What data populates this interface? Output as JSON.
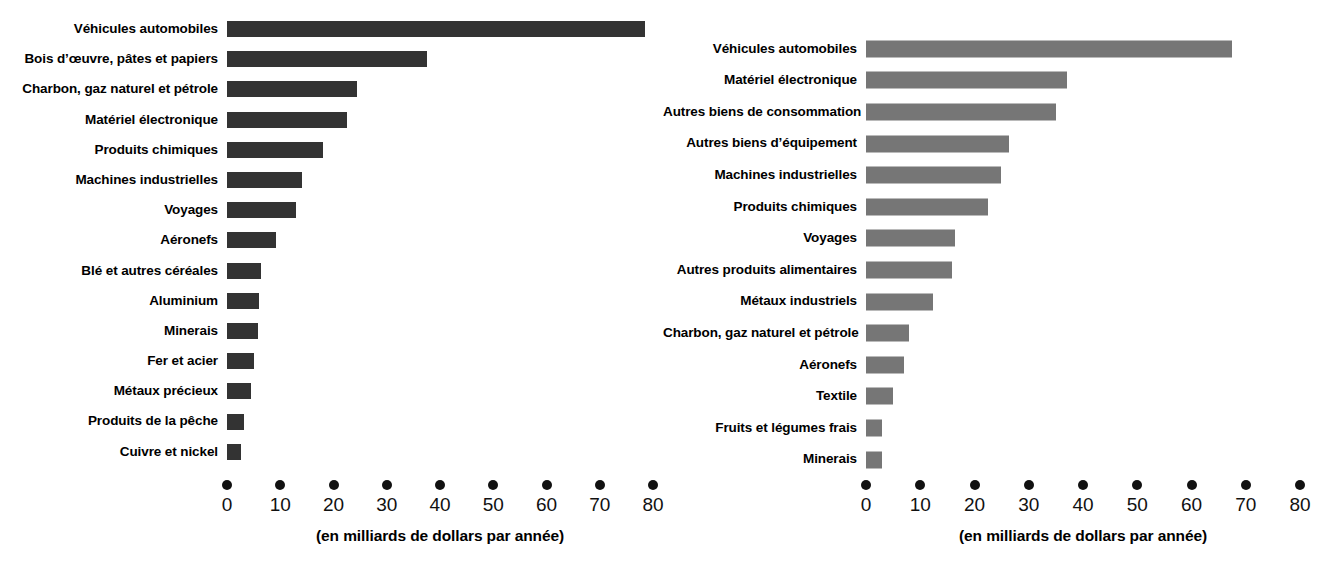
{
  "chart_data": [
    {
      "type": "bar",
      "orientation": "horizontal",
      "panel": "left",
      "title": "",
      "xlabel": "(en milliards de dollars par année)",
      "ylabel": "",
      "xlim": [
        0,
        80
      ],
      "xticks": [
        0,
        10,
        20,
        30,
        40,
        50,
        60,
        70,
        80
      ],
      "tick_style": "dots",
      "grid": false,
      "legend": "none",
      "bar_color": "#333333",
      "categories": [
        "Véhicules automobiles",
        "Bois d’œuvre, pâtes et papiers",
        "Charbon, gaz naturel et pétrole",
        "Matériel électronique",
        "Produits chimiques",
        "Machines industrielles",
        "Voyages",
        "Aéronefs",
        "Blé et autres céréales",
        "Aluminium",
        "Minerais",
        "Fer et acier",
        "Métaux précieux",
        "Produits de la pêche",
        "Cuivre et nickel"
      ],
      "values": [
        78.5,
        37.5,
        24.5,
        22.5,
        18,
        14,
        13,
        9.2,
        6.4,
        6,
        5.8,
        5,
        4.5,
        3.2,
        2.6
      ]
    },
    {
      "type": "bar",
      "orientation": "horizontal",
      "panel": "right",
      "title": "",
      "xlabel": "(en milliards de dollars par année)",
      "ylabel": "",
      "xlim": [
        0,
        80
      ],
      "xticks": [
        0,
        10,
        20,
        30,
        40,
        50,
        60,
        70,
        80
      ],
      "tick_style": "dots",
      "grid": false,
      "legend": "none",
      "bar_color": "#767676",
      "categories": [
        "Véhicules automobiles",
        "Matériel électronique",
        "Autres biens de consommation",
        "Autres biens d’équipement",
        "Machines industrielles",
        "Produits chimiques",
        "Voyages",
        "Autres produits alimentaires",
        "Métaux industriels",
        "Charbon, gaz naturel et pétrole",
        "Aéronefs",
        "Textile",
        "Fruits et légumes frais",
        "Minerais"
      ],
      "values": [
        67.5,
        37,
        35,
        26.3,
        24.9,
        22.5,
        16.4,
        15.8,
        12.3,
        8,
        7,
        5,
        3,
        3
      ]
    }
  ]
}
